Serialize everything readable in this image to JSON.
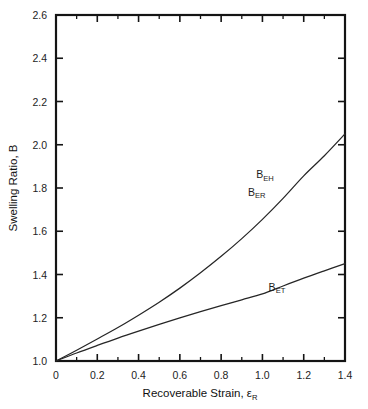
{
  "chart_data": {
    "type": "line",
    "title": "",
    "xlabel": "Recoverable Strain, εR",
    "xlabel_main": "Recoverable Strain, ",
    "xlabel_symbol": "ε",
    "xlabel_sub": "R",
    "ylabel": "Swelling Ratio, B",
    "xlim": [
      0,
      1.4
    ],
    "ylim": [
      1.0,
      2.6
    ],
    "grid": false,
    "legend_position": "inline-annotations",
    "xticks": [
      "0",
      "0.2",
      "0.4",
      "0.6",
      "0.8",
      "1.0",
      "1.2",
      "1.4"
    ],
    "xtick_values": [
      0,
      0.2,
      0.4,
      0.6,
      0.8,
      1.0,
      1.2,
      1.4
    ],
    "xminor_values": [
      0.1,
      0.3,
      0.5,
      0.7,
      0.9,
      1.1,
      1.3
    ],
    "yticks": [
      "1.0",
      "1.2",
      "1.4",
      "1.6",
      "1.8",
      "2.0",
      "2.2",
      "2.4",
      "2.6"
    ],
    "ytick_values": [
      1.0,
      1.2,
      1.4,
      1.6,
      1.8,
      2.0,
      2.2,
      2.4,
      2.6
    ],
    "x": [
      0,
      0.1,
      0.2,
      0.3,
      0.4,
      0.5,
      0.6,
      0.7,
      0.8,
      0.9,
      1.0,
      1.1,
      1.2,
      1.3,
      1.4
    ],
    "series": [
      {
        "name": "BEH / BER",
        "label_main": "B",
        "label_sub_1": "EH",
        "label_sub_2": "ER",
        "annotation_1": "BEH",
        "annotation_2": "BER",
        "values": [
          1.0,
          1.05,
          1.102,
          1.155,
          1.212,
          1.272,
          1.337,
          1.408,
          1.484,
          1.566,
          1.655,
          1.752,
          1.856,
          1.949,
          2.05
        ],
        "color": "#262626"
      },
      {
        "name": "BET",
        "label_main": "B",
        "label_sub": "ET",
        "annotation": "BET",
        "values": [
          1.0,
          1.037,
          1.072,
          1.106,
          1.138,
          1.169,
          1.199,
          1.228,
          1.256,
          1.283,
          1.31,
          1.347,
          1.383,
          1.417,
          1.45
        ],
        "color": "#262626"
      }
    ],
    "annotations": [
      {
        "text_main": "B",
        "text_sub": "EH",
        "x": 0.97,
        "y": 1.845
      },
      {
        "text_main": "B",
        "text_sub": "ER",
        "x": 0.93,
        "y": 1.765
      },
      {
        "text_main": "B",
        "text_sub": "ET",
        "x": 1.03,
        "y": 1.325
      }
    ]
  },
  "axis_titles": {
    "x_prefix": "Recoverable Strain, ",
    "x_symbol": "ε",
    "x_subscript": "R",
    "y": "Swelling Ratio, B"
  },
  "colors": {
    "axis": "#141414",
    "curve": "#262626",
    "background": "#ffffff",
    "text": "#1d1d1d"
  }
}
